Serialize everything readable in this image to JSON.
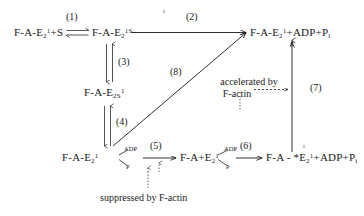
{
  "diagram": {
    "type": "reaction-scheme",
    "species": [
      {
        "id": "s1",
        "label": "F-A-E",
        "sub": "2",
        "sup": "1",
        "tail": "+S"
      },
      {
        "id": "s2",
        "label": "F-A-E",
        "sub": "2",
        "sup": "1S",
        "tail": ""
      },
      {
        "id": "s3",
        "label": "F-A-E",
        "sub": "2",
        "sup": "1",
        "tail": "+ADP+P",
        "tailsub": "i"
      },
      {
        "id": "s4",
        "label": "F-A-E",
        "sub": "2S",
        "sup": "1",
        "tail": ""
      },
      {
        "id": "s5",
        "label": "F-A-E",
        "sub": "2",
        "sup": "1",
        "tail": ""
      },
      {
        "id": "s6",
        "label": "F-A+E",
        "sub": "2",
        "sup": "1",
        "tail": ""
      },
      {
        "id": "s7",
        "label": "F-A - *E",
        "sub": "2",
        "sup": "1",
        "tail": "+ADP+P",
        "tailsub": "i"
      }
    ],
    "species_text": {
      "s1": "F-A-E₂¹+S",
      "s2": "F-A-E₂¹ˢ",
      "s3": "F-A-E₂¹+ADP+Pᵢ",
      "s4": "F-A-E₂ₛ¹",
      "s5": "F-A-E₂¹",
      "s6": "F-A+E₂¹",
      "s7": "F-A - *E₂¹+ADP+Pᵢ"
    },
    "steps": [
      {
        "id": "1",
        "label": "(1)",
        "kind": "equilibrium"
      },
      {
        "id": "2",
        "label": "(2)",
        "kind": "forward"
      },
      {
        "id": "3",
        "label": "(3)",
        "kind": "equilibrium"
      },
      {
        "id": "4",
        "label": "(4)",
        "kind": "equilibrium"
      },
      {
        "id": "5",
        "label": "(5)",
        "kind": "forward"
      },
      {
        "id": "6",
        "label": "(6)",
        "kind": "forward"
      },
      {
        "id": "7",
        "label": "(7)",
        "kind": "forward"
      },
      {
        "id": "8",
        "label": "(8)",
        "kind": "forward"
      }
    ],
    "ligand_tags": [
      {
        "id": "adp-left",
        "text": "ADP"
      },
      {
        "id": "p-left",
        "text": "P"
      },
      {
        "id": "adp-mid",
        "text": "ADP"
      },
      {
        "id": "p-mid",
        "text": "P"
      }
    ],
    "annotations": [
      {
        "id": "accelerated",
        "line1": "accelerated by",
        "line2": "F-actin"
      },
      {
        "id": "suppressed",
        "text": "suppressed by F-actin"
      }
    ],
    "colors": {
      "ink": "#1a1a1a",
      "paper": "#ffffff",
      "speck": "#8d8d8d"
    }
  }
}
